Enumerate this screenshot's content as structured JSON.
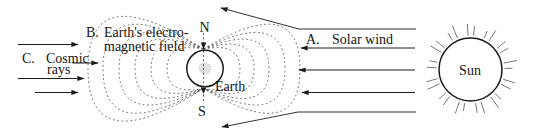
{
  "figure": {
    "background": "#ffffff",
    "ink": "#1c1c1c",
    "field_color": "#3c3c3c",
    "ray_color": "#555555"
  },
  "labels": {
    "cosmic_prefix": "C.",
    "cosmic_word1": "Cosmic",
    "cosmic_word2": "rays",
    "field_prefix": "B.",
    "field_line1": "Earth's electro-",
    "field_line2": "magnetic field",
    "solar_prefix": "A.",
    "solar_label": "Solar wind",
    "north_pole": "N",
    "south_pole": "S",
    "earth": "Earth",
    "sun": "Sun"
  }
}
